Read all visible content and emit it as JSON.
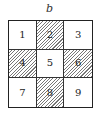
{
  "figure": {
    "label": "b",
    "grid": {
      "rows": 3,
      "cols": 3,
      "cells": [
        {
          "label": "1",
          "shaded": false
        },
        {
          "label": "2",
          "shaded": true
        },
        {
          "label": "3",
          "shaded": false
        },
        {
          "label": "4",
          "shaded": true
        },
        {
          "label": "5",
          "shaded": false
        },
        {
          "label": "6",
          "shaded": true
        },
        {
          "label": "7",
          "shaded": false
        },
        {
          "label": "8",
          "shaded": true
        },
        {
          "label": "9",
          "shaded": false
        }
      ]
    },
    "colors": {
      "border": "#222222",
      "hatch": "#777777",
      "background": "#ffffff"
    }
  }
}
